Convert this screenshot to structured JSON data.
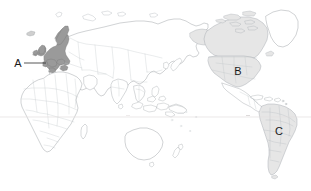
{
  "figure": {
    "type": "world-map",
    "background_color": "#ffffff",
    "projection_note": "equirectangular world map, Europe-Africa left, Americas right",
    "border": "none"
  },
  "map_style": {
    "land_fill": "#ffffff",
    "land_stroke": "#9aa0a6",
    "country_border_color": "#b8bdc2",
    "coastline_color": "#8b9196",
    "equator_line_color": "#e2dede",
    "highlight_dark": "#9a9a9a",
    "highlight_light": "#e6e6e6",
    "label_color": "#1a1a1a",
    "leader_line_color": "#2b2b2b"
  },
  "annotations": {
    "labels": [
      {
        "id": "label-a",
        "text": "A",
        "region": "Europe",
        "x": 18,
        "y": 67,
        "fill": "highlight_dark",
        "has_leader_line": true,
        "leader_from_x": 24,
        "leader_from_y": 63,
        "leader_to_x": 46,
        "leader_to_y": 63
      },
      {
        "id": "label-b",
        "text": "B",
        "region": "North America",
        "x": 234,
        "y": 75,
        "fill": "highlight_light",
        "has_leader_line": false
      },
      {
        "id": "label-c",
        "text": "C",
        "region": "South America",
        "x": 275,
        "y": 135,
        "fill": "highlight_light",
        "has_leader_line": false
      }
    ]
  },
  "graticule": {
    "equator_y": 117,
    "equator_visible": true,
    "tick_marks": [
      {
        "x": 248,
        "y": 117
      },
      {
        "x": 128,
        "y": 117
      }
    ]
  },
  "highlighted_regions": [
    {
      "name": "Europe",
      "label": "A",
      "shade": "dark"
    },
    {
      "name": "United States",
      "label": "B",
      "shade": "light"
    },
    {
      "name": "Canada",
      "label": "",
      "shade": "light"
    },
    {
      "name": "Alaska",
      "label": "",
      "shade": "light"
    },
    {
      "name": "Brazil",
      "label": "C",
      "shade": "light"
    },
    {
      "name": "South America (southern cone)",
      "label": "",
      "shade": "light"
    }
  ]
}
